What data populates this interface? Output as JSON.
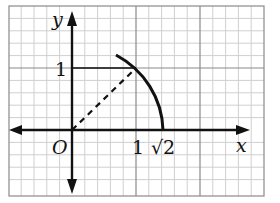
{
  "diagram": {
    "axes": {
      "x_label": "x",
      "y_label": "y",
      "origin_label": "O"
    },
    "ticks": {
      "x_one": "1",
      "y_one": "1",
      "x_sqrt2": "√2"
    },
    "elements": {
      "arc": "quarter-circle arc of radius √2 centered at origin, from about 50° down to the x-axis at √2",
      "dashed_segment": "from O to point (1,1)",
      "solid_segment": "horizontal from (0,1) to (1,1)"
    },
    "colors": {
      "grid_minor": "#cfcfcf",
      "grid_major": "#8a8a8a",
      "ink": "#111111"
    }
  }
}
